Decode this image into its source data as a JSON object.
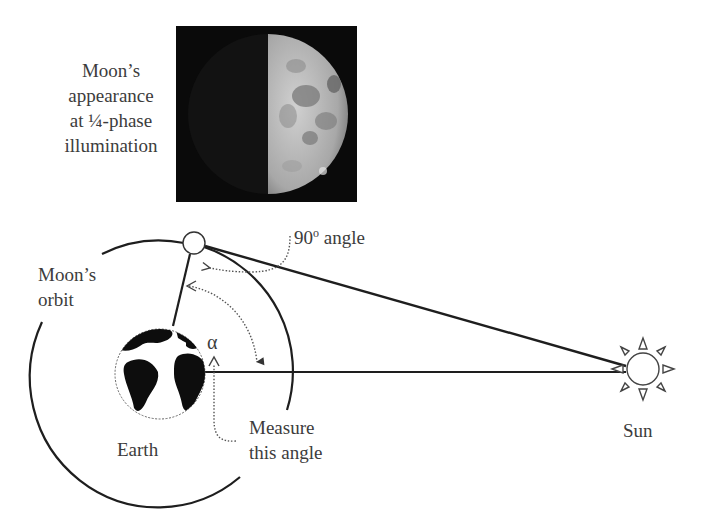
{
  "moon_photo": {
    "caption_lines": [
      "Moon’s",
      "appearance",
      "at ¼-phase",
      "illumination"
    ]
  },
  "labels": {
    "angle_90_value": "90",
    "angle_90_degree": "o",
    "angle_90_word": "angle",
    "moons_orbit_lines": [
      "Moon’s",
      "orbit"
    ],
    "alpha": "α",
    "measure_lines": [
      "Measure",
      "this angle"
    ],
    "earth": "Earth",
    "sun": "Sun"
  },
  "colors": {
    "line": "#1e1e1e",
    "dotted": "#555555",
    "text": "#3c3c3c",
    "photo_bg": "#0a0a0a",
    "moon_lit": "#bdbdbd"
  }
}
